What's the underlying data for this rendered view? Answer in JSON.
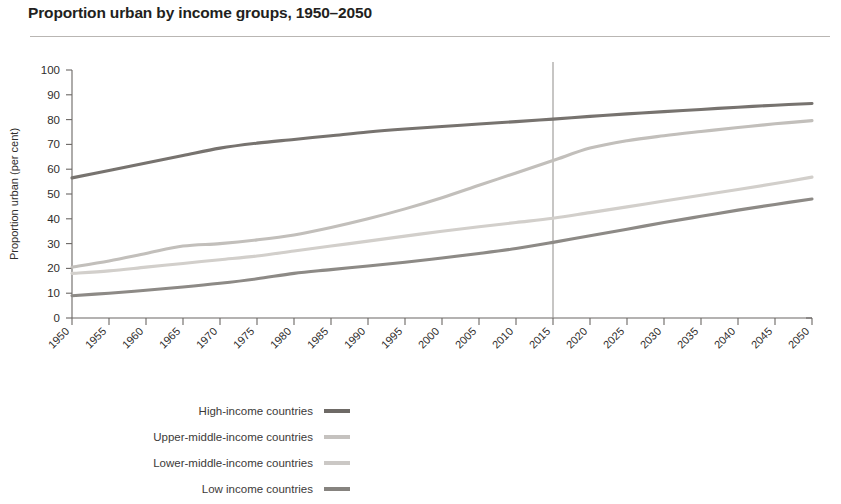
{
  "chart_data": {
    "type": "line",
    "title": "Proportion urban by income groups, 1950–2050",
    "xlabel": "",
    "ylabel": "Proportion urban (per cent)",
    "ylim": [
      0,
      100
    ],
    "xlim": [
      1950,
      2050
    ],
    "ytick_labels": [
      "100",
      "90",
      "80",
      "70",
      "60",
      "50",
      "40",
      "30",
      "20",
      "10",
      "0"
    ],
    "yticks": [
      100,
      90,
      80,
      70,
      60,
      50,
      40,
      30,
      20,
      10,
      0
    ],
    "grid": false,
    "legend_position": "bottom-left",
    "x": [
      1950,
      1955,
      1960,
      1965,
      1970,
      1975,
      1980,
      1985,
      1990,
      1995,
      2000,
      2005,
      2010,
      2015,
      2020,
      2025,
      2030,
      2035,
      2040,
      2045,
      2050
    ],
    "xtick_labels": [
      "1950",
      "1955",
      "1960",
      "1965",
      "1970",
      "1975",
      "1980",
      "1985",
      "1990",
      "1995",
      "2000",
      "2005",
      "2010",
      "2015",
      "2020",
      "2025",
      "2030",
      "2035",
      "2040",
      "2045",
      "2050"
    ],
    "annotations": [
      {
        "name": "projection-divider",
        "type": "vline",
        "x": 2015,
        "label": ""
      }
    ],
    "series": [
      {
        "name": "High-income countries",
        "color": "#77736f",
        "values": [
          56.5,
          59.5,
          62.5,
          65.5,
          68.5,
          70.5,
          72.0,
          73.5,
          75.0,
          76.2,
          77.2,
          78.2,
          79.2,
          80.2,
          81.3,
          82.3,
          83.2,
          84.1,
          85.0,
          85.8,
          86.5
        ]
      },
      {
        "name": "Upper-middle-income countries",
        "color": "#c2bfbb",
        "values": [
          20.5,
          23.0,
          26.0,
          29.0,
          30.0,
          31.5,
          33.5,
          36.5,
          40.0,
          44.0,
          48.5,
          53.5,
          58.5,
          63.5,
          68.5,
          71.5,
          73.5,
          75.2,
          76.8,
          78.3,
          79.6
        ]
      },
      {
        "name": "Lower-middle-income countries",
        "color": "#d2cfcb",
        "values": [
          18.0,
          19.0,
          20.5,
          22.0,
          23.5,
          25.0,
          27.0,
          29.0,
          31.0,
          33.0,
          35.0,
          36.8,
          38.5,
          40.2,
          42.5,
          44.8,
          47.2,
          49.5,
          51.8,
          54.2,
          56.8
        ]
      },
      {
        "name": "Low income countries",
        "color": "#8d8a86",
        "values": [
          9.0,
          10.0,
          11.2,
          12.5,
          14.0,
          15.8,
          18.0,
          19.5,
          21.0,
          22.5,
          24.2,
          26.0,
          28.0,
          30.5,
          33.2,
          35.8,
          38.5,
          41.0,
          43.5,
          45.8,
          48.0
        ]
      }
    ]
  },
  "legend": {
    "items": [
      {
        "label": "High-income countries",
        "color": "#6e6a66"
      },
      {
        "label": "Upper-middle-income countries",
        "color": "#c5c2bf"
      },
      {
        "label": "Lower-middle-income countries",
        "color": "#cbc8c5"
      },
      {
        "label": "Low income countries",
        "color": "#86837f"
      }
    ]
  }
}
